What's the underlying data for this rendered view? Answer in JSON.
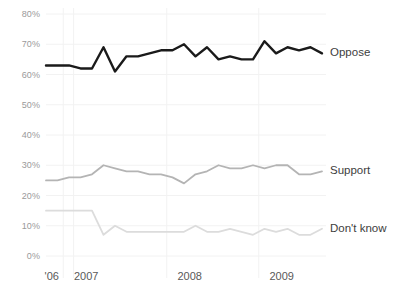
{
  "chart_data": {
    "type": "line",
    "title": "",
    "subtitle": "",
    "xlabel": "",
    "ylabel": "",
    "ylim": [
      0,
      80
    ],
    "yticks": [
      0,
      10,
      20,
      30,
      40,
      50,
      60,
      70,
      80
    ],
    "ytick_labels": [
      "0%",
      "10%",
      "20%",
      "30%",
      "40%",
      "50%",
      "60%",
      "70%",
      "80%"
    ],
    "xtick_labels": [
      "'06",
      "2007",
      "2008",
      "2009"
    ],
    "xtick_positions": [
      0.5,
      3.5,
      12.5,
      20.5
    ],
    "grid": true,
    "grid_axis": "both",
    "legend_position": "right-inline",
    "x_count": 25,
    "series": [
      {
        "name": "Oppose",
        "color": "#1a1a1a",
        "line_width": 2.4,
        "values": [
          63,
          63,
          63,
          62,
          62,
          69,
          61,
          66,
          66,
          67,
          68,
          68,
          70,
          66,
          69,
          65,
          66,
          65,
          65,
          71,
          67,
          69,
          68,
          69,
          67
        ]
      },
      {
        "name": "Support",
        "color": "#b4b4b4",
        "line_width": 1.8,
        "values": [
          25,
          25,
          26,
          26,
          27,
          30,
          29,
          28,
          28,
          27,
          27,
          26,
          24,
          27,
          28,
          30,
          29,
          29,
          30,
          29,
          30,
          30,
          27,
          27,
          28
        ]
      },
      {
        "name": "Don't know",
        "color": "#dcdcdc",
        "line_width": 1.8,
        "values": [
          15,
          15,
          15,
          15,
          15,
          7,
          10,
          8,
          8,
          8,
          8,
          8,
          8,
          10,
          8,
          8,
          9,
          8,
          7,
          9,
          8,
          9,
          7,
          7,
          9
        ]
      }
    ]
  },
  "axis_style": {
    "grid_color": "#f2f2f2",
    "ytick_color": "#9a9a9a",
    "xtick_color": "#595959",
    "background": "#ffffff"
  }
}
